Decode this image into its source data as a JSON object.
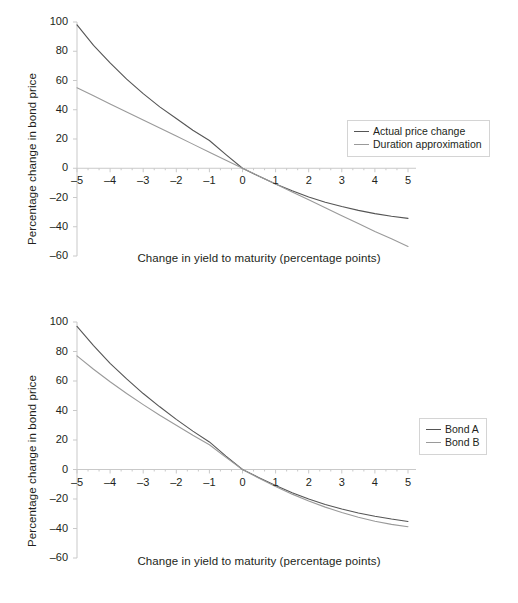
{
  "figure": {
    "panels": [
      {
        "id": "top",
        "axis_title_x": "Change in yield to maturity (percentage points)",
        "axis_title_y": "Percentage change in bond price",
        "legend": [
          {
            "label": "Actual price change",
            "color": "#555555"
          },
          {
            "label": "Duration approximation",
            "color": "#9a9a9a"
          }
        ]
      },
      {
        "id": "bottom",
        "axis_title_x": "Change in yield to maturity (percentage points)",
        "axis_title_y": "Percentage change in bond price",
        "legend": [
          {
            "label": "Bond A",
            "color": "#555555"
          },
          {
            "label": "Bond B",
            "color": "#9a9a9a"
          }
        ]
      }
    ],
    "axis_color": "#c9c9c9",
    "tick_color": "#c9c9c9"
  },
  "chart_data": [
    {
      "type": "line",
      "id": "convexity-actual-vs-duration",
      "title": "",
      "xlabel": "Change in yield to maturity (percentage points)",
      "ylabel": "Percentage change in bond price",
      "xlim": [
        -5,
        5
      ],
      "ylim": [
        -60,
        100
      ],
      "xticks": [
        -5,
        -4,
        -3,
        -2,
        -1,
        0,
        1,
        2,
        3,
        4,
        5
      ],
      "xtick_labels": [
        "–5",
        "–4",
        "–3",
        "–2",
        "–1",
        "0",
        "1",
        "2",
        "3",
        "4",
        "5"
      ],
      "yticks": [
        -60,
        -40,
        -20,
        0,
        20,
        40,
        60,
        80,
        100
      ],
      "ytick_labels": [
        "–60",
        "–40",
        "–20",
        "0",
        "20",
        "40",
        "60",
        "80",
        "100"
      ],
      "minor_xticks_per_interval": 2,
      "grid": false,
      "legend_position": "upper right",
      "x": [
        -5,
        -4.5,
        -4,
        -3.5,
        -3,
        -2.5,
        -2,
        -1.5,
        -1,
        -0.5,
        0,
        0.5,
        1,
        1.5,
        2,
        2.5,
        3,
        3.5,
        4,
        4.5,
        5
      ],
      "series": [
        {
          "name": "Actual price change",
          "color": "#555555",
          "values": [
            98,
            84,
            72,
            61,
            51,
            42,
            34,
            26,
            19,
            9.3,
            0,
            -5.5,
            -10.7,
            -15.4,
            -19.6,
            -23.2,
            -26.2,
            -28.8,
            -31,
            -32.8,
            -34.3
          ]
        },
        {
          "name": "Duration approximation",
          "color": "#9a9a9a",
          "values": [
            55,
            49.5,
            44,
            38.5,
            33,
            27.5,
            22,
            16.5,
            11,
            5.5,
            0,
            -5.4,
            -10.8,
            -16.2,
            -21.6,
            -27,
            -32.4,
            -37.8,
            -43.2,
            -48.2,
            -53.5
          ]
        }
      ]
    },
    {
      "type": "line",
      "id": "bond-a-vs-bond-b-convexity",
      "title": "",
      "xlabel": "Change in yield to maturity (percentage points)",
      "ylabel": "Percentage change in bond price",
      "xlim": [
        -5,
        5
      ],
      "ylim": [
        -60,
        100
      ],
      "xticks": [
        -5,
        -4,
        -3,
        -2,
        -1,
        0,
        1,
        2,
        3,
        4,
        5
      ],
      "xtick_labels": [
        "–5",
        "–4",
        "–3",
        "–2",
        "–1",
        "0",
        "1",
        "2",
        "3",
        "4",
        "5"
      ],
      "yticks": [
        -60,
        -40,
        -20,
        0,
        20,
        40,
        60,
        80,
        100
      ],
      "ytick_labels": [
        "–60",
        "–40",
        "–20",
        "0",
        "20",
        "40",
        "60",
        "80",
        "100"
      ],
      "minor_xticks_per_interval": 2,
      "grid": false,
      "legend_position": "right",
      "x": [
        -5,
        -4.5,
        -4,
        -3.5,
        -3,
        -2.5,
        -2,
        -1.5,
        -1,
        -0.5,
        0,
        0.5,
        1,
        1.5,
        2,
        2.5,
        3,
        3.5,
        4,
        4.5,
        5
      ],
      "series": [
        {
          "name": "Bond A",
          "color": "#555555",
          "values": [
            97,
            84,
            72,
            61.5,
            51.5,
            42.5,
            34,
            26,
            18.7,
            9.1,
            0,
            -5.6,
            -10.9,
            -15.7,
            -20,
            -23.7,
            -26.8,
            -29.5,
            -31.7,
            -33.6,
            -35.2
          ]
        },
        {
          "name": "Bond B",
          "color": "#9a9a9a",
          "values": [
            77,
            68,
            59.5,
            51.5,
            44,
            36.8,
            30,
            23.2,
            16.8,
            8.2,
            0,
            -5.9,
            -11.5,
            -16.7,
            -21.4,
            -25.5,
            -29.2,
            -32.4,
            -35.1,
            -37.2,
            -38.8
          ]
        }
      ]
    }
  ]
}
